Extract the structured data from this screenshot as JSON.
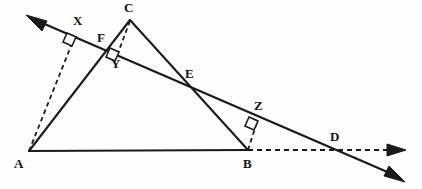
{
  "figure": {
    "background_color": "#fefefe",
    "ink_color": "#1a1a1a"
  },
  "labels": {
    "A": "A",
    "B": "B",
    "C": "C",
    "D": "D",
    "E": "E",
    "F": "F",
    "X": "X",
    "Y": "Y",
    "Z": "Z"
  },
  "points": {
    "A": {
      "x": 29,
      "y": 151,
      "label_x": 14,
      "label_y": 157
    },
    "B": {
      "x": 248,
      "y": 150,
      "label_x": 243,
      "label_y": 157
    },
    "C": {
      "x": 130,
      "y": 19,
      "label_x": 125,
      "label_y": 2
    },
    "D": {
      "x": 336,
      "y": 150,
      "label_x": 330,
      "label_y": 131
    },
    "E": {
      "x": 186,
      "y": 86,
      "label_x": 186,
      "label_y": 68
    },
    "F": {
      "x": 108,
      "y": 48,
      "label_x": 97,
      "label_y": 31
    },
    "X": {
      "x": 74,
      "y": 37,
      "label_x": 74,
      "label_y": 15
    },
    "Y": {
      "x": 117,
      "y": 52,
      "label_x": 112,
      "label_y": 56
    },
    "Z": {
      "x": 256,
      "y": 121,
      "label_x": 255,
      "label_y": 100
    }
  },
  "segments": [
    {
      "name": "side-AB",
      "from": "A",
      "to": "B",
      "style": "solid"
    },
    {
      "name": "side-AC",
      "from": "A",
      "to": "C",
      "style": "solid"
    },
    {
      "name": "side-CB",
      "from": "C",
      "to": "B",
      "style": "solid"
    },
    {
      "name": "perpendicular-AX",
      "from": "A",
      "to": "X",
      "style": "dashed"
    },
    {
      "name": "perpendicular-CY",
      "from": "C",
      "to": "Y",
      "style": "dashed"
    },
    {
      "name": "perpendicular-BZ",
      "from": "B",
      "to": "Z",
      "style": "dashed"
    },
    {
      "name": "extension-BD",
      "from": "B",
      "to": "D",
      "style": "dashed"
    }
  ],
  "rays": [
    {
      "name": "transversal-line",
      "style": "solid",
      "arrows": "both"
    },
    {
      "name": "base-extension-ray",
      "style": "dashed",
      "arrows": "end"
    }
  ],
  "right_angles": [
    {
      "name": "right-angle-at-X",
      "at": "X"
    },
    {
      "name": "right-angle-at-Y",
      "at": "Y"
    },
    {
      "name": "right-angle-at-Z",
      "at": "Z"
    }
  ],
  "arrow_tips": {
    "transversal_upper_left": {
      "x": 27,
      "y": 16
    },
    "transversal_lower_right": {
      "x": 404,
      "y": 181
    },
    "base_extension_right": {
      "x": 405,
      "y": 150
    }
  }
}
